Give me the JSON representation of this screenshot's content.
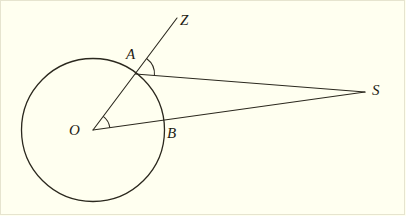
{
  "figure": {
    "background_color": "#fffff0",
    "ink_color": "#1d1b14",
    "width": 406,
    "height": 216,
    "labels": {
      "center": "O",
      "point_on_circle_upper": "A",
      "point_on_circle_lower": "B",
      "ray_end": "Z",
      "external_point": "S"
    },
    "label_positions": {
      "center": {
        "x": 69,
        "y": 123
      },
      "point_on_circle_upper": {
        "x": 126,
        "y": 47
      },
      "point_on_circle_lower": {
        "x": 167,
        "y": 126
      },
      "ray_end": {
        "x": 180,
        "y": 13
      },
      "external_point": {
        "x": 372,
        "y": 83
      }
    },
    "geometry": {
      "circle": {
        "cx": 93,
        "cy": 130,
        "r": 71.5,
        "stroke_width": 1.3
      },
      "points": {
        "O": {
          "x": 93,
          "y": 130
        },
        "A": {
          "x": 135.5,
          "y": 74
        },
        "B": {
          "x": 163.5,
          "y": 124
        },
        "S": {
          "x": 365,
          "y": 92
        },
        "Z": {
          "x": 177,
          "y": 18
        }
      },
      "segments": [
        {
          "name": "ray-O-Z",
          "from": "O",
          "to": "Z"
        },
        {
          "name": "segment-A-S",
          "from": "A",
          "to": "S"
        },
        {
          "name": "segment-O-S",
          "from": "O",
          "to": "S"
        }
      ],
      "angle_arcs": [
        {
          "name": "angle-at-O",
          "vertex": "O",
          "radius": 17
        },
        {
          "name": "angle-at-A",
          "vertex": "A",
          "radius": 19
        }
      ]
    }
  }
}
